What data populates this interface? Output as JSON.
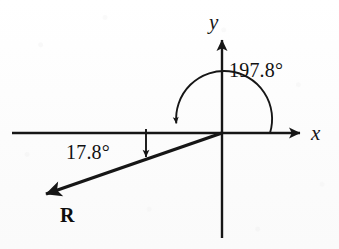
{
  "figure": {
    "kind": "vector-angle-diagram",
    "background_color": "#fdfdfd",
    "ink_color": "#161616"
  },
  "axes": {
    "x_label": "x",
    "y_label": "y",
    "origin": {
      "x": 222,
      "y": 133
    },
    "x_axis": {
      "start_x": 12,
      "tip_x": 300,
      "y": 133
    },
    "y_axis": {
      "x": 222,
      "tip_y": 38,
      "bottom_y": 238
    }
  },
  "angles": [
    {
      "id": "standard-angle",
      "label": "197.8°",
      "value": 197.8,
      "unit": "degree",
      "measured_from": "positive x-axis",
      "direction": "counterclockwise",
      "arc_radius": 48
    },
    {
      "id": "reference-angle",
      "label": "17.8°",
      "value": 17.8,
      "unit": "degree",
      "measured_from": "negative x-axis",
      "direction": "clockwise-below-axis"
    }
  ],
  "vector": {
    "label": "R",
    "name": "resultant-vector",
    "tail": {
      "x": 222,
      "y": 133
    },
    "tip": {
      "x": 42,
      "y": 197
    },
    "direction_degrees": 197.8
  }
}
